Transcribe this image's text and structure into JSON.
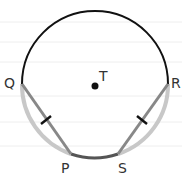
{
  "diagram": {
    "type": "circle-geometry",
    "center": {
      "label": "T",
      "x": 95,
      "y": 86
    },
    "radius": 73,
    "points": [
      {
        "label": "Q",
        "x": 22,
        "y": 84
      },
      {
        "label": "R",
        "x": 168,
        "y": 84
      },
      {
        "label": "P",
        "x": 71,
        "y": 154
      },
      {
        "label": "S",
        "x": 118,
        "y": 154
      }
    ],
    "segments": [
      {
        "from": "Q",
        "to": "P",
        "tick": true
      },
      {
        "from": "S",
        "to": "R",
        "tick": true
      }
    ],
    "arcs": [
      {
        "from": "Q",
        "to": "R",
        "via": "top",
        "color": "#111111"
      },
      {
        "from": "Q",
        "to": "P",
        "color": "#c8c8c8"
      },
      {
        "from": "S",
        "to": "R",
        "color": "#c8c8c8"
      },
      {
        "from": "P",
        "to": "S",
        "color": "#555555"
      }
    ],
    "colors": {
      "major_arc": "#111111",
      "minor_arc": "#c8c8c8",
      "chord": "#888888",
      "bottom_arc": "#555555",
      "rule_lines": "#ececec"
    }
  }
}
